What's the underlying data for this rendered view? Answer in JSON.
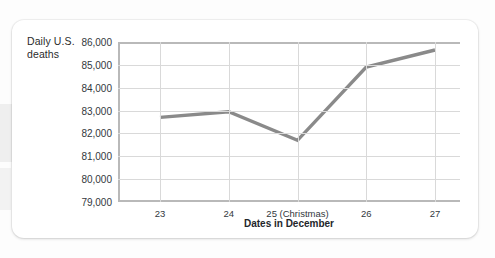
{
  "chart_data": {
    "type": "line",
    "title": "",
    "xlabel": "Dates in December",
    "ylabel": "Daily U.S. deaths",
    "categories": [
      "23",
      "24",
      "25 (Christmas)",
      "26",
      "27"
    ],
    "values": [
      82700,
      82950,
      81700,
      84900,
      85650
    ],
    "series": [
      {
        "name": "Daily U.S. deaths",
        "values": [
          82700,
          82950,
          81700,
          84900,
          85650
        ]
      }
    ],
    "ylim": [
      79000,
      86000
    ],
    "ytick_labels": [
      "86,000",
      "85,000",
      "84,000",
      "83,000",
      "82,000",
      "81,000",
      "80,000",
      "79,000"
    ],
    "ytick_values": [
      86000,
      85000,
      84000,
      83000,
      82000,
      81000,
      80000,
      79000
    ],
    "xtick_labels": [
      "23",
      "24",
      "25 (Christmas)",
      "26",
      "27"
    ],
    "grid": true,
    "legend": "none",
    "line_color": "#8a8a8a"
  },
  "colors": {
    "line": "#8a8a8a",
    "gridline": "#d9d9d9",
    "axis": "#b9b9b9",
    "text": "#33383d",
    "card_background": "#ffffff"
  }
}
